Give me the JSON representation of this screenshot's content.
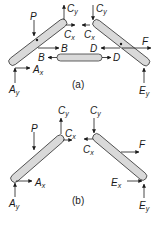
{
  "figure": {
    "colors": {
      "member_fill": "#d9d9d9",
      "member_stroke": "#3a3a3a",
      "arrow": "#1a1a1a",
      "background": "#ffffff"
    },
    "panel_a": {
      "caption": "(a)",
      "labels": {
        "P": "P",
        "Cy_left": "C",
        "Cy_left_sub": "y",
        "Cx_left": "C",
        "Cx_left_sub": "x",
        "Cy_right": "C",
        "Cy_right_sub": "y",
        "Cx_right": "C",
        "Cx_right_sub": "x",
        "B_top": "B",
        "B_link": "B",
        "D_top": "D",
        "D_link": "D",
        "F": "F",
        "Ax": "A",
        "Ax_sub": "x",
        "Ay": "A",
        "Ay_sub": "y",
        "Ey": "E",
        "Ey_sub": "y"
      }
    },
    "panel_b": {
      "caption": "(b)",
      "labels": {
        "P": "P",
        "Cy_left": "C",
        "Cy_left_sub": "y",
        "Cx_left": "C",
        "Cx_left_sub": "x",
        "Cy_right": "C",
        "Cy_right_sub": "y",
        "Cx_right": "C",
        "Cx_right_sub": "x",
        "F": "F",
        "Ax": "A",
        "Ax_sub": "x",
        "Ay": "A",
        "Ay_sub": "y",
        "Ex": "E",
        "Ex_sub": "x",
        "Ey": "E",
        "Ey_sub": "y"
      }
    }
  }
}
